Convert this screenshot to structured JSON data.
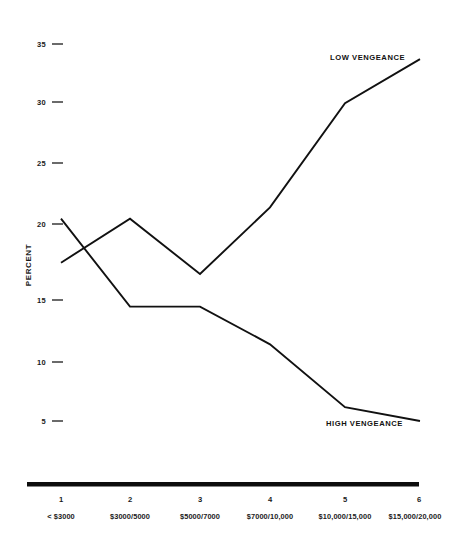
{
  "chart_data": {
    "type": "line",
    "title": "",
    "subtitle": "",
    "xlabel": "",
    "ylabel": "PERCENT",
    "ylim": [
      0,
      36.5
    ],
    "yticks": [
      5,
      10,
      15,
      20,
      25,
      30,
      35
    ],
    "ytick_labels": [
      "5",
      "10",
      "15",
      "20",
      "25",
      "30",
      "35"
    ],
    "grid": false,
    "legend_position": "inline-end-of-line",
    "x": [
      1,
      2,
      3,
      4,
      5,
      6
    ],
    "categories": [
      "1",
      "2",
      "3",
      "4",
      "5",
      "6"
    ],
    "xtick_numbers": [
      "1",
      "2",
      "3",
      "4",
      "5",
      "6"
    ],
    "xtick_ranges": [
      "< $3000",
      "$3000/5000",
      "$5000/7000",
      "$7000/10,000",
      "$10,000/15,000",
      "$15,000/20,000"
    ],
    "series": [
      {
        "name": "LOW VENGEANCE",
        "label": "LOW VENGEANCE",
        "values": [
          17.6,
          21.1,
          16.7,
          22.0,
          30.3,
          33.8
        ],
        "color": "#111111"
      },
      {
        "name": "HIGH VENGEANCE",
        "label": "HIGH VENGEANCE",
        "values": [
          21.1,
          14.1,
          14.1,
          11.1,
          6.1,
          5.0
        ],
        "color": "#111111"
      }
    ],
    "annotations": [
      {
        "text": "LOW VENGEANCE",
        "series": "LOW VENGEANCE"
      },
      {
        "text": "HIGH VENGEANCE",
        "series": "HIGH VENGEANCE"
      }
    ]
  }
}
